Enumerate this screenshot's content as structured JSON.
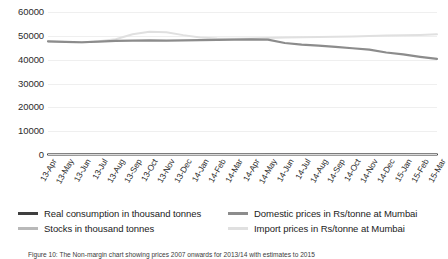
{
  "chart_data": {
    "type": "line",
    "title": "",
    "xlabel": "",
    "ylabel": "",
    "ylim": [
      0,
      60000
    ],
    "ytick_values": [
      60000,
      50000,
      40000,
      30000,
      20000,
      10000,
      0
    ],
    "ytick_labels": [
      "60000",
      "50000",
      "40000",
      "30000",
      "20000",
      "10000",
      "0"
    ],
    "grid": true,
    "legend_position": "bottom",
    "categories": [
      "13-Apr",
      "13-May",
      "13-Jun",
      "13-Jul",
      "13-Aug",
      "13-Sep",
      "13-Oct",
      "13-Nov",
      "13-Dec",
      "14-Jan",
      "14-Feb",
      "14-Mar",
      "14-Apr",
      "14-May",
      "14-Jun",
      "14-Jul",
      "14-Aug",
      "14-Sep",
      "14-Oct",
      "14-Nov",
      "14-Dec",
      "15-Jan",
      "15-Feb",
      "15-Mar"
    ],
    "series": [
      {
        "name": "Real consumption in thousand tonnes",
        "color": "#3f3f3f",
        "width": 2.0,
        "values": [
          210,
          215,
          205,
          220,
          215,
          210,
          225,
          220,
          215,
          210,
          205,
          215,
          220,
          225,
          215,
          210,
          220,
          215,
          210,
          215,
          220,
          210,
          205,
          215
        ]
      },
      {
        "name": "Stocks in thousand tonnes",
        "color": "#b9b9b9",
        "width": 2.0,
        "values": [
          330,
          360,
          390,
          420,
          450,
          470,
          470,
          450,
          430,
          400,
          380,
          360,
          350,
          370,
          400,
          430,
          450,
          460,
          450,
          430,
          400,
          380,
          360,
          350
        ]
      },
      {
        "name": "Domestic prices in Rs/tonne at Mumbai",
        "color": "#8c8c8c",
        "width": 2.2,
        "values": [
          47700,
          47500,
          47300,
          47600,
          47900,
          48000,
          48100,
          48000,
          48100,
          48200,
          48300,
          48400,
          48500,
          48400,
          47000,
          46300,
          45900,
          45400,
          44800,
          44200,
          43000,
          42200,
          41200,
          40300
        ]
      },
      {
        "name": "Import prices in Rs/tonne at Mumbai",
        "color": "#e0e0e0",
        "width": 2.0,
        "values": [
          47600,
          47400,
          47200,
          47700,
          48600,
          50700,
          51700,
          51500,
          50300,
          49300,
          48900,
          48800,
          48900,
          49100,
          49300,
          49400,
          49500,
          49600,
          49700,
          49900,
          50100,
          50200,
          50400,
          50700
        ]
      }
    ]
  },
  "caption": {
    "text": "Figure 10: The Non-margin chart showing prices 2007 onwards for 2013/14 with estimates to 2015"
  }
}
